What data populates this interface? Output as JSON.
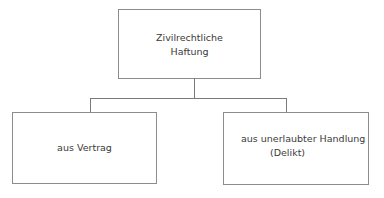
{
  "diagram": {
    "type": "tree",
    "root": {
      "id": "zivilrechtliche-haftung",
      "lines": [
        "Zivilrechtliche",
        "Haftung"
      ]
    },
    "children": [
      {
        "id": "aus-vertrag",
        "lines": [
          "aus Vertrag"
        ]
      },
      {
        "id": "aus-unerlaubter-handlung",
        "lines": [
          "aus unerlaubter Handlung",
          "(Delikt)"
        ]
      }
    ],
    "edges": [
      {
        "from": "zivilrechtliche-haftung",
        "to": "aus-vertrag"
      },
      {
        "from": "zivilrechtliche-haftung",
        "to": "aus-unerlaubter-handlung"
      }
    ]
  },
  "colors": {
    "border": "#8c8c8c",
    "connector": "#7a7a7a",
    "text": "#3a3a3a",
    "background": "#ffffff"
  }
}
